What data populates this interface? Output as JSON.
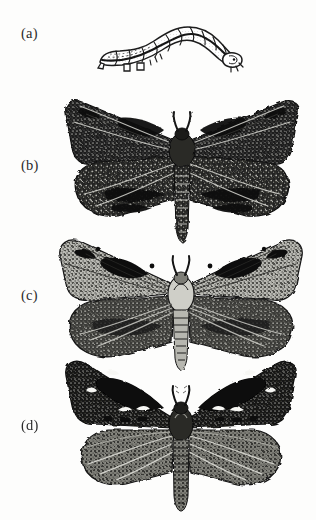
{
  "figure": {
    "type": "scientific-plate",
    "medium": "black-and-white engraving / halftone photograph",
    "background_color": "#fdfdfc",
    "ink_color": "#1a1a1a",
    "panel_count": 4
  },
  "panels": [
    {
      "id": "a",
      "label": "(a)",
      "label_x": 21,
      "label_y": 25,
      "subject": "caterpillar-larva",
      "description": "Pale looper caterpillar in arched posture, head to right, segmented body with prolegs",
      "bbox": {
        "x": 95,
        "y": 14,
        "w": 145,
        "h": 56
      },
      "tone": "light"
    },
    {
      "id": "b",
      "label": "(b)",
      "label_x": 21,
      "label_y": 157,
      "subject": "moth-dark-melanic",
      "description": "Moth with wings spread, very dark mottled forewings and hindwings, pale speckling, stout banded abdomen",
      "bbox": {
        "x": 63,
        "y": 96,
        "w": 238,
        "h": 156
      },
      "tone": "dark"
    },
    {
      "id": "c",
      "label": "(c)",
      "label_x": 21,
      "label_y": 287,
      "subject": "moth-pale-typica",
      "description": "Moth with wings spread, lighter grey speckled forewings bearing dark blotches, broad dark hindwings, pale thorax",
      "bbox": {
        "x": 54,
        "y": 233,
        "w": 253,
        "h": 140
      },
      "tone": "light-mottled"
    },
    {
      "id": "d",
      "label": "(d)",
      "label_x": 21,
      "label_y": 417,
      "subject": "moth-dark-spotted",
      "description": "Moth with wings spread, blackish forewings with white crescent spots along outer margin, paler streaked hindwings, long tapering abdomen",
      "bbox": {
        "x": 66,
        "y": 357,
        "w": 230,
        "h": 150
      },
      "tone": "dark-with-white-spots"
    }
  ],
  "colors": {
    "ink": "#1a1a1a",
    "midtone": "#555555",
    "light": "#c9c9c4",
    "paper": "#fdfdfc",
    "label_text": "#2b2b2b"
  }
}
